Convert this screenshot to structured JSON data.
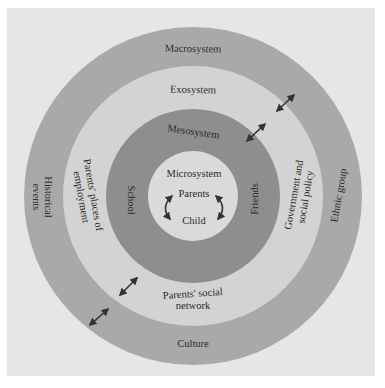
{
  "diagram": {
    "type": "concentric-rings",
    "center": [
      193,
      196
    ],
    "colors": {
      "background": "#e6e6e6",
      "macrosystem": "#a9a9a9",
      "exosystem": "#d3d3d3",
      "mesosystem": "#8e8e8e",
      "microsystem": "#dadada",
      "text": "#2a2a2a",
      "arrow": "#333333"
    },
    "rings": [
      {
        "name": "Macrosystem",
        "radius": 169,
        "items": [
          "Historical events",
          "Ethnic group",
          "Culture"
        ]
      },
      {
        "name": "Exosystem",
        "radius": 130,
        "items": [
          "Parents' places of employment",
          "Government and social policy",
          "Parents' social network"
        ]
      },
      {
        "name": "Mesosystem",
        "radius": 87,
        "items": [
          "School",
          "Friends"
        ]
      },
      {
        "name": "Microsystem",
        "radius": 45,
        "items": [
          "Parents",
          "Child"
        ]
      }
    ]
  },
  "labels": {
    "macrosystem": "Macrosystem",
    "exosystem": "Exosystem",
    "mesosystem": "Mesosystem",
    "microsystem": "Microsystem",
    "parents": "Parents",
    "child": "Child",
    "school": "School",
    "friends": "Friends",
    "employment_line1": "Parents' places of",
    "employment_line2": "employment",
    "government_line1": "Government and",
    "government_line2": "social policy",
    "social_network_line1": "Parents' social",
    "social_network_line2": "network",
    "historical_line1": "Historical",
    "historical_line2": "events",
    "ethnic_group": "Ethnic group",
    "culture": "Culture"
  }
}
